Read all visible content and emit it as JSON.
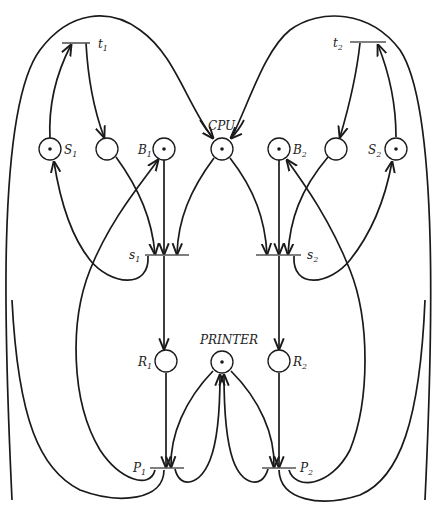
{
  "diagram": {
    "type": "petri-net",
    "places": [
      {
        "id": "S1",
        "label": "S",
        "sub": "1",
        "token": true
      },
      {
        "id": "p_t1_s1",
        "label": "",
        "sub": "",
        "token": false
      },
      {
        "id": "B1",
        "label": "B",
        "sub": "1",
        "token": true
      },
      {
        "id": "CPU",
        "label": "CPU",
        "sub": "",
        "token": true
      },
      {
        "id": "B2",
        "label": "B",
        "sub": "2",
        "token": true
      },
      {
        "id": "p_t2_s2",
        "label": "",
        "sub": "",
        "token": false
      },
      {
        "id": "S2",
        "label": "S",
        "sub": "2",
        "token": true
      },
      {
        "id": "R1",
        "label": "R",
        "sub": "1",
        "token": false
      },
      {
        "id": "PRINTER",
        "label": "PRINTER",
        "sub": "",
        "token": true
      },
      {
        "id": "R2",
        "label": "R",
        "sub": "2",
        "token": false
      }
    ],
    "transitions": [
      {
        "id": "t1",
        "label": "t",
        "sub": "1"
      },
      {
        "id": "t2",
        "label": "t",
        "sub": "2"
      },
      {
        "id": "s1",
        "label": "s",
        "sub": "1"
      },
      {
        "id": "s2",
        "label": "s",
        "sub": "2"
      },
      {
        "id": "P1",
        "label": "P",
        "sub": "1"
      },
      {
        "id": "P2",
        "label": "P",
        "sub": "2"
      }
    ],
    "arcs": [
      [
        "S1",
        "t1"
      ],
      [
        "t1",
        "p_t1_s1"
      ],
      [
        "t1",
        "CPU"
      ],
      [
        "S2",
        "t2"
      ],
      [
        "t2",
        "p_t2_s2"
      ],
      [
        "t2",
        "CPU"
      ],
      [
        "p_t1_s1",
        "s1"
      ],
      [
        "B1",
        "s1"
      ],
      [
        "CPU",
        "s1"
      ],
      [
        "s1",
        "S1"
      ],
      [
        "s1",
        "R1"
      ],
      [
        "p_t2_s2",
        "s2"
      ],
      [
        "B2",
        "s2"
      ],
      [
        "CPU",
        "s2"
      ],
      [
        "s2",
        "S2"
      ],
      [
        "s2",
        "R2"
      ],
      [
        "R1",
        "P1"
      ],
      [
        "PRINTER",
        "P1"
      ],
      [
        "P1",
        "PRINTER"
      ],
      [
        "P1",
        "B1"
      ],
      [
        "P1",
        "t1"
      ],
      [
        "R2",
        "P2"
      ],
      [
        "PRINTER",
        "P2"
      ],
      [
        "P2",
        "PRINTER"
      ],
      [
        "P2",
        "B2"
      ],
      [
        "P2",
        "t2"
      ]
    ]
  },
  "labels": {
    "t1": "t",
    "t1_sub": "1",
    "t2": "t",
    "t2_sub": "2",
    "S1": "S",
    "S1_sub": "1",
    "S2": "S",
    "S2_sub": "2",
    "B1": "B",
    "B1_sub": "1",
    "B2": "B",
    "B2_sub": "2",
    "CPU": "CPU",
    "s1": "s",
    "s1_sub": "1",
    "s2": "s",
    "s2_sub": "2",
    "R1": "R",
    "R1_sub": "1",
    "R2": "R",
    "R2_sub": "2",
    "PRINTER": "PRINTER",
    "P1": "P",
    "P1_sub": "1",
    "P2": "P",
    "P2_sub": "2"
  }
}
